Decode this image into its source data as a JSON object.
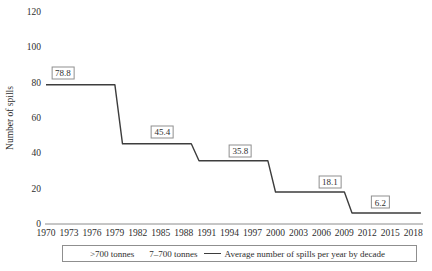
{
  "chart_data": {
    "type": "line",
    "title": "",
    "xlabel": "",
    "ylabel": "Number of spills",
    "ylim": [
      0,
      120
    ],
    "xlim": [
      1970,
      2019
    ],
    "grid": false,
    "yticks": [
      0,
      20,
      40,
      60,
      80,
      100,
      120
    ],
    "xticks": [
      1970,
      1973,
      1976,
      1979,
      1982,
      1985,
      1988,
      1991,
      1994,
      1997,
      2000,
      2003,
      2006,
      2009,
      2012,
      2015,
      2018
    ],
    "series": [
      {
        "name": "Average number of spills per year by decade",
        "color": "#3d3d3d",
        "points": [
          [
            1970,
            78.8
          ],
          [
            1979,
            78.8
          ],
          [
            1980,
            45.4
          ],
          [
            1989,
            45.4
          ],
          [
            1990,
            35.8
          ],
          [
            1999,
            35.8
          ],
          [
            2000,
            18.1
          ],
          [
            2009,
            18.1
          ],
          [
            2010,
            6.2
          ],
          [
            2019,
            6.2
          ]
        ]
      }
    ],
    "decade_averages": [
      {
        "decade": "1970s",
        "value": 78.8
      },
      {
        "decade": "1980s",
        "value": 45.4
      },
      {
        "decade": "1990s",
        "value": 35.8
      },
      {
        "decade": "2000s",
        "value": 18.1
      },
      {
        "decade": "2010s",
        "value": 6.2
      }
    ],
    "annotations": [
      {
        "label": "78.8",
        "x": 1972.2,
        "y": 85.5
      },
      {
        "label": "45.4",
        "x": 1985.2,
        "y": 52.1
      },
      {
        "label": "35.8",
        "x": 1995.4,
        "y": 41.6
      },
      {
        "label": "18.1",
        "x": 2007.1,
        "y": 23.8
      },
      {
        "label": "6.2",
        "x": 2013.7,
        "y": 12.2
      }
    ],
    "legend": {
      "position": "bottom",
      "entries": [
        {
          "label": ">700 tonnes",
          "swatch": "none"
        },
        {
          "label": "7–700 tonnes",
          "swatch": "none"
        },
        {
          "label": "Average number of spills per year by decade",
          "swatch": "line"
        }
      ]
    },
    "colors": {
      "line": "#3d3d3d",
      "axis": "#808080",
      "text": "#2e2e2e",
      "box_border": "#8f8f8f",
      "background": "#ffffff"
    }
  }
}
